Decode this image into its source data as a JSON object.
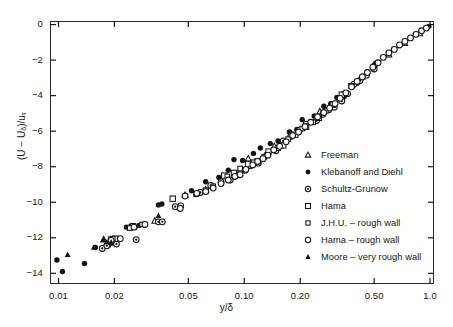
{
  "chart_data": {
    "type": "scatter",
    "title": "",
    "xlabel": "y/δ",
    "ylabel": "(U − Uδ)/uτ",
    "ylabel_parts": {
      "prefix": "(U − U",
      "sub1": "δ",
      "mid": ")/u",
      "sub2": "τ"
    },
    "xscale": "log",
    "yscale": "linear",
    "xlim": [
      0.009,
      1.05
    ],
    "ylim": [
      -14.6,
      0.2
    ],
    "grid": false,
    "legend_position": "center-right",
    "xticks": [
      0.01,
      0.02,
      0.05,
      0.1,
      0.2,
      0.5,
      1.0
    ],
    "xtick_labels": [
      "0.01",
      "0.02",
      "0.05",
      "0.10",
      "0.20",
      "0.50",
      "1.0"
    ],
    "yticks": [
      0,
      -2,
      -4,
      -6,
      -8,
      -10,
      -12,
      -14
    ],
    "ytick_labels": [
      "0",
      "−2",
      "−4",
      "−6",
      "−8",
      "−10",
      "−12",
      "−14"
    ],
    "series": [
      {
        "name": "Freeman",
        "marker": "triangle-open",
        "points": [
          [
            0.0175,
            -12.1
          ],
          [
            0.033,
            -11.05
          ],
          [
            0.048,
            -9.6
          ],
          [
            0.062,
            -9.3
          ],
          [
            0.105,
            -7.55
          ],
          [
            0.145,
            -6.85
          ],
          [
            0.178,
            -6.15
          ],
          [
            0.255,
            -4.9
          ],
          [
            0.29,
            -4.55
          ],
          [
            0.335,
            -3.95
          ],
          [
            0.43,
            -2.95
          ],
          [
            0.5,
            -2.25
          ],
          [
            0.6,
            -1.7
          ],
          [
            0.73,
            -1.05
          ],
          [
            0.88,
            -0.5
          ]
        ]
      },
      {
        "name": "Klebanoff and Diehl",
        "marker": "circle-filled",
        "points": [
          [
            0.0105,
            -13.9
          ],
          [
            0.0098,
            -13.25
          ],
          [
            0.0138,
            -13.45
          ],
          [
            0.0158,
            -12.55
          ],
          [
            0.0185,
            -12.45
          ],
          [
            0.0195,
            -12.3
          ],
          [
            0.0205,
            -12.25
          ],
          [
            0.0232,
            -11.4
          ],
          [
            0.0245,
            -11.35
          ],
          [
            0.0258,
            -11.4
          ],
          [
            0.0272,
            -11.3
          ],
          [
            0.0345,
            -10.15
          ],
          [
            0.036,
            -10.1
          ],
          [
            0.052,
            -9.35
          ],
          [
            0.062,
            -8.85
          ],
          [
            0.073,
            -8.6
          ],
          [
            0.082,
            -8.2
          ],
          [
            0.088,
            -7.6
          ],
          [
            0.098,
            -7.65
          ],
          [
            0.112,
            -7.25
          ],
          [
            0.122,
            -6.95
          ],
          [
            0.138,
            -6.7
          ],
          [
            0.152,
            -6.55
          ],
          [
            0.175,
            -6.05
          ],
          [
            0.192,
            -5.9
          ],
          [
            0.205,
            -5.35
          ],
          [
            0.238,
            -5.15
          ],
          [
            0.268,
            -4.6
          ],
          [
            0.292,
            -4.45
          ],
          [
            0.315,
            -4.1
          ],
          [
            0.345,
            -4.05
          ],
          [
            0.385,
            -3.45
          ],
          [
            0.405,
            -3.3
          ],
          [
            0.5,
            -2.3
          ],
          [
            0.985,
            -0.1
          ]
        ]
      },
      {
        "name": "Schultz-Grunow",
        "marker": "circle-dot",
        "points": [
          [
            0.0172,
            -12.6
          ],
          [
            0.0182,
            -12.45
          ],
          [
            0.0205,
            -12.35
          ],
          [
            0.0262,
            -12.1
          ],
          [
            0.0345,
            -11.1
          ],
          [
            0.0362,
            -11.1
          ],
          [
            0.0425,
            -10.25
          ],
          [
            0.0455,
            -10.2
          ],
          [
            0.058,
            -9.45
          ],
          [
            0.066,
            -9.05
          ],
          [
            0.075,
            -8.85
          ],
          [
            0.084,
            -8.75
          ],
          [
            0.092,
            -8.45
          ],
          [
            0.101,
            -8.2
          ],
          [
            0.108,
            -7.95
          ],
          [
            0.119,
            -7.8
          ],
          [
            0.132,
            -7.35
          ],
          [
            0.148,
            -7.1
          ],
          [
            0.162,
            -6.55
          ],
          [
            0.178,
            -6.3
          ],
          [
            0.198,
            -5.95
          ],
          [
            0.215,
            -5.6
          ],
          [
            0.245,
            -5.4
          ],
          [
            0.265,
            -5.05
          ],
          [
            0.285,
            -4.8
          ],
          [
            0.305,
            -4.65
          ],
          [
            0.335,
            -4.3
          ],
          [
            0.36,
            -3.9
          ],
          [
            0.39,
            -3.35
          ],
          [
            0.42,
            -3.15
          ],
          [
            0.455,
            -2.85
          ],
          [
            0.5,
            -2.5
          ]
        ]
      },
      {
        "name": "Hama",
        "marker": "square-open",
        "points": [
          [
            0.0192,
            -12.1
          ],
          [
            0.0202,
            -12.05
          ],
          [
            0.0252,
            -11.35
          ],
          [
            0.0412,
            -9.8
          ],
          [
            0.062,
            -9.35
          ],
          [
            0.078,
            -8.5
          ],
          [
            0.088,
            -8.35
          ],
          [
            0.105,
            -7.85
          ],
          [
            0.118,
            -7.7
          ],
          [
            0.135,
            -7.15
          ],
          [
            0.162,
            -6.8
          ],
          [
            0.188,
            -6.2
          ],
          [
            0.215,
            -5.75
          ],
          [
            0.252,
            -5.25
          ],
          [
            0.3,
            -4.5
          ],
          [
            0.335,
            -3.95
          ]
        ]
      },
      {
        "name": "J.H.U. – rough wall",
        "marker": "square-open-small",
        "points": [
          [
            0.0196,
            -12.05
          ],
          [
            0.0242,
            -11.45
          ],
          [
            0.0282,
            -11.25
          ],
          [
            0.055,
            -9.55
          ],
          [
            0.068,
            -9.1
          ],
          [
            0.081,
            -8.55
          ],
          [
            0.095,
            -8.1
          ],
          [
            0.112,
            -7.75
          ],
          [
            0.128,
            -7.45
          ],
          [
            0.152,
            -6.95
          ],
          [
            0.172,
            -6.45
          ],
          [
            0.205,
            -5.85
          ],
          [
            0.235,
            -5.5
          ],
          [
            0.275,
            -4.85
          ],
          [
            0.325,
            -4.15
          ],
          [
            0.375,
            -3.45
          ]
        ]
      },
      {
        "name": "Hama – rough wall",
        "marker": "diamond-open",
        "points": [
          [
            0.0192,
            -12.15
          ],
          [
            0.0215,
            -12.05
          ],
          [
            0.0255,
            -11.4
          ],
          [
            0.0292,
            -11.25
          ],
          [
            0.0452,
            -10.35
          ],
          [
            0.048,
            -9.65
          ],
          [
            0.0555,
            -9.5
          ],
          [
            0.062,
            -9.4
          ],
          [
            0.068,
            -9.2
          ],
          [
            0.075,
            -8.95
          ],
          [
            0.082,
            -8.75
          ],
          [
            0.089,
            -8.55
          ],
          [
            0.095,
            -8.45
          ],
          [
            0.102,
            -8.15
          ],
          [
            0.111,
            -7.9
          ],
          [
            0.118,
            -7.7
          ],
          [
            0.126,
            -7.55
          ],
          [
            0.134,
            -7.35
          ],
          [
            0.144,
            -7.05
          ],
          [
            0.155,
            -6.85
          ],
          [
            0.168,
            -6.6
          ],
          [
            0.182,
            -6.25
          ],
          [
            0.196,
            -6.05
          ],
          [
            0.212,
            -5.75
          ],
          [
            0.228,
            -5.5
          ],
          [
            0.248,
            -5.2
          ],
          [
            0.268,
            -4.95
          ],
          [
            0.288,
            -4.7
          ],
          [
            0.308,
            -4.45
          ],
          [
            0.328,
            -4.15
          ],
          [
            0.352,
            -3.85
          ],
          [
            0.378,
            -3.5
          ],
          [
            0.405,
            -3.2
          ],
          [
            0.432,
            -2.95
          ],
          [
            0.46,
            -2.7
          ],
          [
            0.492,
            -2.4
          ],
          [
            0.525,
            -2.15
          ],
          [
            0.56,
            -1.85
          ],
          [
            0.6,
            -1.6
          ],
          [
            0.642,
            -1.4
          ],
          [
            0.685,
            -1.15
          ],
          [
            0.732,
            -0.95
          ],
          [
            0.785,
            -0.75
          ],
          [
            0.84,
            -0.55
          ],
          [
            0.9,
            -0.35
          ],
          [
            0.955,
            -0.2
          ]
        ]
      },
      {
        "name": "Moore – very rough wall",
        "marker": "triangle-filled",
        "points": [
          [
            0.0112,
            -12.95
          ],
          [
            0.0155,
            -12.55
          ],
          [
            0.0175,
            -12.1
          ],
          [
            0.0182,
            -12.25
          ],
          [
            0.0192,
            -12.25
          ],
          [
            0.0345,
            -10.75
          ]
        ]
      }
    ]
  },
  "legend": {
    "items": [
      {
        "label": "Freeman",
        "marker": "triangle-open"
      },
      {
        "label": "Klebanoff and Diehl",
        "marker": "circle-filled"
      },
      {
        "label": "Schultz-Grunow",
        "marker": "circle-dot"
      },
      {
        "label": "Hama",
        "marker": "square-open"
      },
      {
        "label": "J.H.U. – rough wall",
        "marker": "square-open-small"
      },
      {
        "label": "Hama – rough wall",
        "marker": "diamond-open"
      },
      {
        "label": "Moore – very rough wall",
        "marker": "triangle-filled"
      }
    ]
  },
  "colors": {
    "ink": "#141414",
    "frame": "#2a2a2a",
    "background": "#fffffe"
  }
}
